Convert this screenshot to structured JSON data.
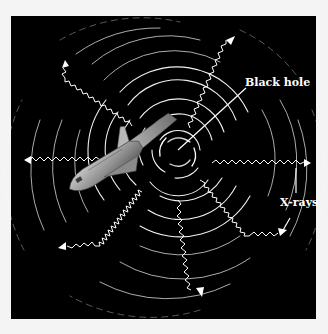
{
  "figure": {
    "background": "#f4f4f4",
    "panel_color": "#000000",
    "stroke_color": "#ffffff",
    "labels": {
      "black_hole": "Black hole",
      "xrays": "X-rays"
    },
    "objects": [
      "black hole",
      "accretion swirl",
      "space shuttle",
      "x-ray arrows"
    ]
  }
}
